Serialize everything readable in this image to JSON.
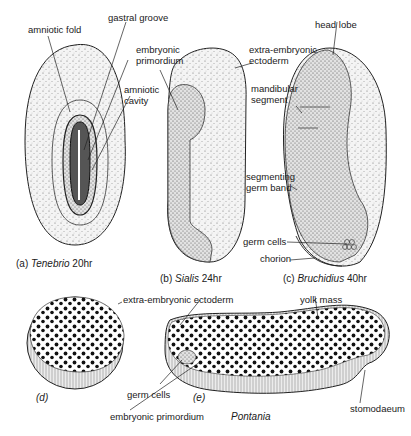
{
  "figure": {
    "panels": [
      {
        "id": "a",
        "caption_prefix": "(a)",
        "species": "Tenebrio",
        "time": "20hr"
      },
      {
        "id": "b",
        "caption_prefix": "(b)",
        "species": "Sialis",
        "time": "24hr"
      },
      {
        "id": "c",
        "caption_prefix": "(c)",
        "species": "Bruchidius",
        "time": "40hr"
      },
      {
        "id": "d",
        "caption_prefix": "(d)"
      },
      {
        "id": "e",
        "caption_prefix": "(e)",
        "species": "Pontania"
      }
    ],
    "labels": {
      "amniotic_fold": "amniotic fold",
      "gastral_groove": "gastral groove",
      "embryonic_primordium_top": "embryonic\nprimordium",
      "embryonic_primordium_top_1": "embryonic",
      "embryonic_primordium_top_2": "primordium",
      "amniotic_cavity_1": "amniotic",
      "amniotic_cavity_2": "cavity",
      "extra_embryonic_ectoderm_1": "extra-embryonic",
      "extra_embryonic_ectoderm_2": "ectoderm",
      "head_lobe": "head lobe",
      "mandibular_segment_1": "mandibular",
      "mandibular_segment_2": "segment",
      "segmenting_germ_band_1": "segmenting",
      "segmenting_germ_band_2": "germ band",
      "germ_cells_c": "germ cells",
      "chorion": "chorion",
      "extra_embryonic_ectoderm_bottom": "extra-embryonic ectoderm",
      "yolk_mass": "yolk mass",
      "germ_cells_bottom": "germ cells",
      "embryonic_primordium_bottom": "embryonic primordium",
      "stomodaeum": "stomodaeum"
    }
  }
}
